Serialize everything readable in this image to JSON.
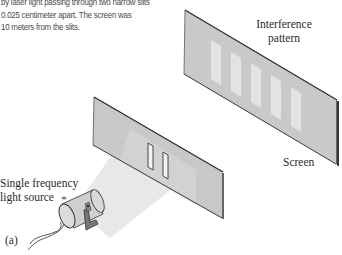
{
  "figure": {
    "caption_lines": [
      "by laser light passing through two narrow slits",
      "0.025 centimeter apart. The screen was",
      "10 meters from the slits."
    ],
    "labels": {
      "interference_line1": "Interference",
      "interference_line2": "pattern",
      "screen": "Screen",
      "source_line1": "Single frequency",
      "source_line2": "light source",
      "panel": "(a)"
    },
    "components": [
      {
        "name": "light-source",
        "description": "cylindrical single frequency light source on a bracket with cord"
      },
      {
        "name": "double-slit-barrier",
        "slit_count": 2
      },
      {
        "name": "screen",
        "fringe_count": 5
      }
    ],
    "colors": {
      "panel_face": "#c8c8c8",
      "panel_edge": "#2a2a2a",
      "fringe": "#e2e2e2",
      "beam": "#e9e9e9",
      "text": "#2b2b2b"
    }
  }
}
